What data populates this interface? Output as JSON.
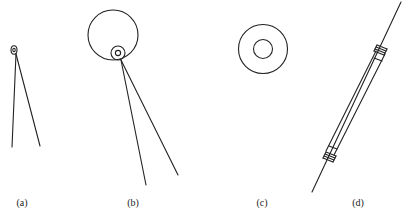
{
  "figure": {
    "panels": [
      {
        "id": "a",
        "label": "(a)",
        "description": "Small loop at apex with two diverging straight lines (V shape)"
      },
      {
        "id": "b",
        "label": "(b)",
        "description": "Large circle with small concentric ring at bottom, two diverging lines downward"
      },
      {
        "id": "c",
        "label": "(c)",
        "description": "Two concentric circles (ring / washer)"
      },
      {
        "id": "d",
        "label": "(d)",
        "description": "Long diagonal tube with coiled end caps, threaded by a line"
      }
    ],
    "stroke_color": "#222222",
    "background_color": "#ffffff"
  }
}
